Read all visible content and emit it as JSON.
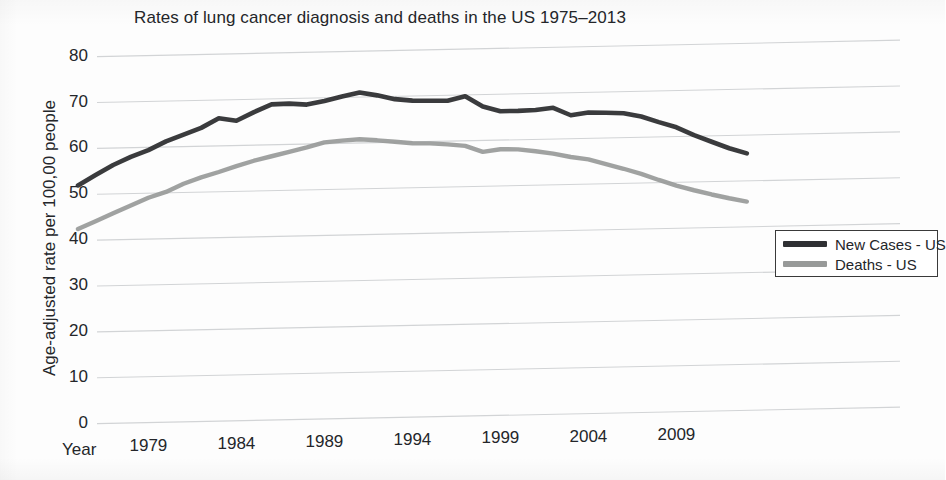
{
  "chart_data": {
    "type": "line",
    "title": "Rates of lung cancer diagnosis and deaths in the US 1975–2013",
    "xlabel": "Year",
    "ylabel": "Age-adjusted rate per 100,00 people",
    "xlim": [
      1975,
      2013
    ],
    "ylim": [
      0,
      80
    ],
    "grid": "horizontal",
    "legend_position": "bottom-right",
    "y_ticks": [
      0,
      10,
      20,
      30,
      40,
      50,
      60,
      70,
      80
    ],
    "y_tick_labels": [
      "0",
      "10",
      "20",
      "30",
      "40",
      "50",
      "60",
      "70",
      "80"
    ],
    "x_ticks": [
      1979,
      1984,
      1989,
      1994,
      1999,
      2004,
      2009
    ],
    "x_tick_labels": [
      "1979",
      "1984",
      "1989",
      "1994",
      "1999",
      "2004",
      "2009"
    ],
    "x": [
      1975,
      1976,
      1977,
      1978,
      1979,
      1980,
      1981,
      1982,
      1983,
      1984,
      1985,
      1986,
      1987,
      1988,
      1989,
      1990,
      1991,
      1992,
      1993,
      1994,
      1995,
      1996,
      1997,
      1998,
      1999,
      2000,
      2001,
      2002,
      2003,
      2004,
      2005,
      2006,
      2007,
      2008,
      2009,
      2010,
      2011,
      2012,
      2013
    ],
    "series": [
      {
        "name": "New Cases - US",
        "color": "#2f3033",
        "values": [
          52.0,
          54.2,
          56.3,
          58.0,
          59.4,
          61.2,
          62.6,
          64.0,
          66.0,
          65.4,
          67.2,
          68.8,
          68.9,
          68.6,
          69.3,
          70.2,
          71.0,
          70.3,
          69.4,
          69.0,
          68.9,
          68.8,
          69.7,
          67.4,
          66.3,
          66.3,
          66.4,
          66.8,
          65.1,
          65.6,
          65.5,
          65.3,
          64.5,
          63.2,
          62.0,
          60.2,
          58.7,
          57.2,
          56.0
        ]
      },
      {
        "name": "Deaths - US",
        "color": "#989a99",
        "values": [
          42.5,
          44.1,
          45.8,
          47.4,
          49.0,
          50.2,
          51.9,
          53.2,
          54.3,
          55.5,
          56.6,
          57.5,
          58.4,
          59.3,
          60.3,
          60.6,
          60.8,
          60.5,
          60.1,
          59.7,
          59.6,
          59.3,
          58.9,
          57.5,
          58.0,
          57.9,
          57.4,
          56.8,
          56.0,
          55.4,
          54.3,
          53.2,
          52.0,
          50.6,
          49.3,
          48.2,
          47.2,
          46.3,
          45.5
        ]
      }
    ]
  },
  "legend": {
    "items": [
      {
        "label": "New Cases - US",
        "color": "#2f3033"
      },
      {
        "label": "Deaths - US",
        "color": "#989a99"
      }
    ]
  }
}
